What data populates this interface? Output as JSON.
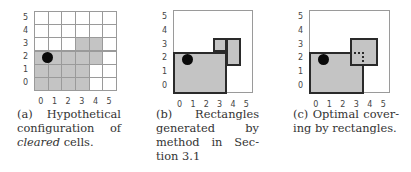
{
  "figure": {
    "panels": [
      {
        "id": "a",
        "caption_lines": [
          "(a)   Hypothetical",
          "configuration    of",
          "cleared cells."
        ],
        "caption_label": "(a)",
        "caption_text": "Hypothetical configuration of cleared cells.",
        "caption_emphasis": "cleared"
      },
      {
        "id": "b",
        "caption_lines": [
          "(b)       Rectangles",
          "generated          by",
          "method   in   Sec-",
          "tion 3.1"
        ],
        "caption_label": "(b)",
        "caption_text": "Rectangles generated by method in Section 3.1"
      },
      {
        "id": "c",
        "caption_lines": [
          "(c) Optimal cover-",
          "ing by rectangles."
        ],
        "caption_label": "(c)",
        "caption_text": "Optimal covering by rectangles."
      }
    ],
    "axis_ticks": {
      "x": [
        "0",
        "1",
        "2",
        "3",
        "4",
        "5"
      ],
      "y": [
        "5",
        "4",
        "3",
        "2",
        "1",
        "0"
      ]
    },
    "grid_size": 6,
    "cleared_cells": [
      [
        0,
        0
      ],
      [
        1,
        0
      ],
      [
        2,
        0
      ],
      [
        3,
        0
      ],
      [
        0,
        1
      ],
      [
        1,
        1
      ],
      [
        2,
        1
      ],
      [
        3,
        1
      ],
      [
        0,
        2
      ],
      [
        1,
        2
      ],
      [
        2,
        2
      ],
      [
        3,
        2
      ],
      [
        4,
        2
      ],
      [
        3,
        3
      ],
      [
        4,
        3
      ]
    ],
    "robot_position": {
      "x": 1,
      "y": 2.5
    },
    "rectangles_b": [
      {
        "x0": 0,
        "y0": 0,
        "x1": 4,
        "y1": 3
      },
      {
        "x0": 3,
        "y0": 3,
        "x1": 4,
        "y1": 4
      },
      {
        "x0": 4,
        "y0": 2,
        "x1": 5,
        "y1": 4
      }
    ],
    "rectangles_c": [
      {
        "x0": 0,
        "y0": 0,
        "x1": 4,
        "y1": 3,
        "style": "solid"
      },
      {
        "x0": 3,
        "y0": 2,
        "x1": 5,
        "y1": 4,
        "style": "solid"
      },
      {
        "x0": 3,
        "y0": 2,
        "x1": 4,
        "y1": 3,
        "style": "dotted"
      }
    ],
    "colors": {
      "cleared": "#c4c4c4",
      "grid_line": "#9a9a9a",
      "rect_border": "#2a2a2a",
      "robot": "#0a0a0a"
    }
  }
}
